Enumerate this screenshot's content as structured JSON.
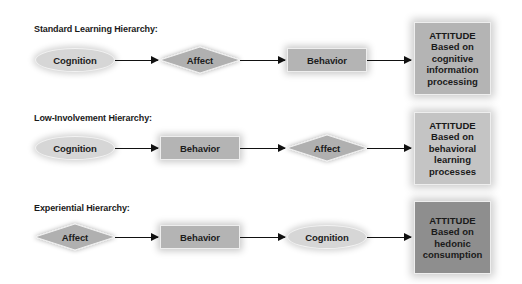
{
  "diagram": {
    "rows": [
      {
        "label": "Standard Learning Hierarchy:",
        "steps": [
          {
            "text": "Cognition",
            "shape": "ellipse"
          },
          {
            "text": "Affect",
            "shape": "diamond"
          },
          {
            "text": "Behavior",
            "shape": "rectangle"
          }
        ],
        "result": {
          "title": "ATTITUDE",
          "lines": [
            "Based on",
            "cognitive",
            "information",
            "processing"
          ],
          "fill": "#b4b4b4"
        }
      },
      {
        "label": "Low-Involvement Hierarchy:",
        "steps": [
          {
            "text": "Cognition",
            "shape": "ellipse"
          },
          {
            "text": "Behavior",
            "shape": "rectangle"
          },
          {
            "text": "Affect",
            "shape": "diamond"
          }
        ],
        "result": {
          "title": "ATTITUDE",
          "lines": [
            "Based on",
            "behavioral",
            "learning",
            "processes"
          ],
          "fill": "#c4c4c4"
        }
      },
      {
        "label": "Experiential Hierarchy:",
        "steps": [
          {
            "text": "Affect",
            "shape": "diamond"
          },
          {
            "text": "Behavior",
            "shape": "rectangle"
          },
          {
            "text": "Cognition",
            "shape": "ellipse"
          }
        ],
        "result": {
          "title": "ATTITUDE",
          "lines": [
            "Based on",
            "hedonic",
            "consumption"
          ],
          "fill": "#8e8e8e"
        }
      }
    ],
    "colors": {
      "ellipse_fill": "#d6d6d6",
      "diamond_fill": "#b0b0b0",
      "rectangle_fill": "#b4b4b4",
      "arrow": "#111111"
    }
  }
}
